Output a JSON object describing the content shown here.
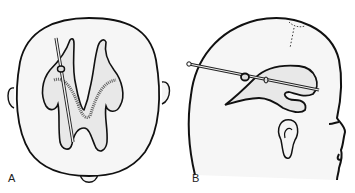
{
  "figure": {
    "panels": [
      {
        "label": "A",
        "view": "top-view-head-ventricles-with-catheter"
      },
      {
        "label": "B",
        "view": "lateral-view-head-ventricle-with-catheter"
      }
    ],
    "colors": {
      "outline": "#111111",
      "skin_fill": "#f6f6f6",
      "ventricle_fill": "#e6e6e6",
      "shading": "#555555"
    }
  }
}
